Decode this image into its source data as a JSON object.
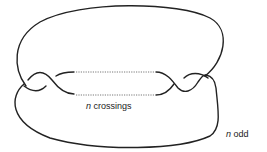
{
  "diagram": {
    "label_crossings_var": "n",
    "label_crossings_text": "crossings",
    "label_parity_var": "n",
    "label_parity_text": "odd",
    "stroke_color": "#222222"
  }
}
